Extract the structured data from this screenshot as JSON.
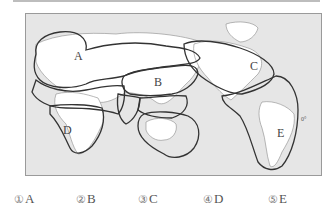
{
  "map": {
    "region_labels": [
      "A",
      "B",
      "C",
      "D",
      "E"
    ],
    "equator_label": "0°",
    "colors": {
      "ocean": "#e6e6e6",
      "land": "#ffffff",
      "boundary": "#333333"
    }
  },
  "options": [
    {
      "number": "①",
      "label": "A"
    },
    {
      "number": "②",
      "label": "B"
    },
    {
      "number": "③",
      "label": "C"
    },
    {
      "number": "④",
      "label": "D"
    },
    {
      "number": "⑤",
      "label": "E"
    }
  ]
}
